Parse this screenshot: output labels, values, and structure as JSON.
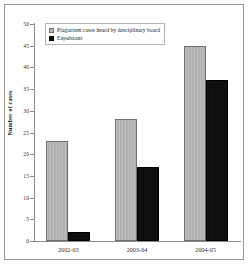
{
  "chart_data": {
    "type": "bar",
    "title": "",
    "xlabel": "",
    "ylabel": "Number of cases",
    "categories": [
      "2002-03",
      "2003-04",
      "2004-05"
    ],
    "ylim": [
      0,
      50
    ],
    "yticks": [
      0,
      5,
      10,
      15,
      20,
      25,
      30,
      35,
      40,
      45,
      50
    ],
    "grid": false,
    "legend_position": "top-left-inside",
    "series": [
      {
        "name": "Plagiarism cases heard by desciplinary board",
        "color": "#b2b2b2",
        "values": [
          23,
          28,
          45
        ]
      },
      {
        "name": "Expulsions",
        "color": "#0a0a0a",
        "values": [
          2,
          17,
          37
        ]
      }
    ]
  }
}
